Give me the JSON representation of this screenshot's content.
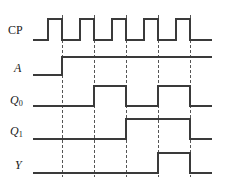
{
  "figure": {
    "kind": "digital-timing-diagram",
    "width": 229,
    "height": 188,
    "background_color": "#ffffff",
    "line_color": "#3a3a3a",
    "dashed_line_color": "#555555",
    "label_color": "#1a1a1a"
  },
  "labels": {
    "cp": "CP",
    "a": "A",
    "q0_base": "Q",
    "q0_sub": "0",
    "q1_base": "Q",
    "q1_sub": "1",
    "y": "Y"
  },
  "chart_data": {
    "type": "line",
    "title": "",
    "xlabel": "",
    "ylabel": "",
    "grid": false,
    "legend_position": "left-axis-labels",
    "x_domain": [
      33,
      212
    ],
    "x_unit": "px",
    "marker_lines": {
      "style": "dashed",
      "label": "clock falling edges",
      "x": [
        62,
        94,
        126,
        158,
        190
      ]
    },
    "levels": {
      "low": 0,
      "high": 1
    },
    "series": [
      {
        "name": "CP",
        "row_index": 0,
        "baseline_y": 40,
        "high_y": 19,
        "initial_level": 0,
        "transitions": [
          {
            "x": 48,
            "to": 1
          },
          {
            "x": 62,
            "to": 0
          },
          {
            "x": 80,
            "to": 1
          },
          {
            "x": 94,
            "to": 0
          },
          {
            "x": 112,
            "to": 1
          },
          {
            "x": 126,
            "to": 0
          },
          {
            "x": 144,
            "to": 1
          },
          {
            "x": 158,
            "to": 0
          },
          {
            "x": 176,
            "to": 1
          },
          {
            "x": 190,
            "to": 0
          }
        ],
        "final_level": 0
      },
      {
        "name": "A",
        "row_index": 1,
        "baseline_y": 75,
        "high_y": 57,
        "initial_level": 0,
        "transitions": [
          {
            "x": 62,
            "to": 1
          }
        ],
        "final_level": 1
      },
      {
        "name": "Q0",
        "row_index": 2,
        "baseline_y": 106,
        "high_y": 86,
        "initial_level": 0,
        "transitions": [
          {
            "x": 94,
            "to": 1
          },
          {
            "x": 126,
            "to": 0
          },
          {
            "x": 158,
            "to": 1
          },
          {
            "x": 190,
            "to": 0
          }
        ],
        "final_level": 0
      },
      {
        "name": "Q1",
        "row_index": 3,
        "baseline_y": 139,
        "high_y": 119,
        "initial_level": 0,
        "transitions": [
          {
            "x": 126,
            "to": 1
          },
          {
            "x": 190,
            "to": 0
          }
        ],
        "final_level": 0
      },
      {
        "name": "Y",
        "row_index": 4,
        "baseline_y": 173,
        "high_y": 153,
        "initial_level": 0,
        "transitions": [
          {
            "x": 158,
            "to": 1
          },
          {
            "x": 190,
            "to": 0
          }
        ],
        "final_level": 0
      }
    ]
  },
  "label_positions": [
    {
      "key": "cp",
      "name": "CP",
      "x": 8,
      "y": 24,
      "font_size": 12,
      "upright": true
    },
    {
      "key": "a",
      "name": "A",
      "x": 14,
      "y": 62,
      "font_size": 12,
      "upright": false
    },
    {
      "key": "q0",
      "name": "Q0",
      "x": 10,
      "y": 94,
      "font_size": 12,
      "upright": false
    },
    {
      "key": "q1",
      "name": "Q1",
      "x": 10,
      "y": 125,
      "font_size": 12,
      "upright": false
    },
    {
      "key": "y",
      "name": "Y",
      "x": 15,
      "y": 159,
      "font_size": 12,
      "upright": false
    }
  ]
}
